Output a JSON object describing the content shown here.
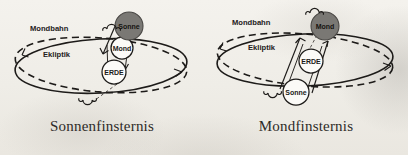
{
  "figure": {
    "background_color": "#f1efea",
    "ink_color": "#1d1b19",
    "shaded_body_color": "#7a7874"
  },
  "panels": [
    {
      "id": "solar-eclipse",
      "caption": "Sonnenfinsternis",
      "orbit_labels": {
        "moon_orbit": "Mondbahn",
        "ecliptic": "Ekliptik"
      },
      "bodies": [
        {
          "name": "Sonne",
          "label": "Sonne",
          "fill": "shaded",
          "position": "top"
        },
        {
          "name": "Mond",
          "label": "Mond",
          "fill": "open",
          "position": "middle"
        },
        {
          "name": "Erde",
          "label": "ERDE",
          "fill": "open",
          "position": "bottom"
        }
      ],
      "nodes": [
        {
          "name": "ascending-node",
          "symbol": "☊",
          "position": "top-left-of-sun"
        },
        {
          "name": "descending-node",
          "symbol": "☋",
          "position": "bottom-of-ellipse"
        }
      ]
    },
    {
      "id": "lunar-eclipse",
      "caption": "Mondfinsternis",
      "orbit_labels": {
        "moon_orbit": "Mondbahn",
        "ecliptic": "Ekliptik"
      },
      "bodies": [
        {
          "name": "Mond",
          "label": "Mond",
          "fill": "shaded",
          "position": "top"
        },
        {
          "name": "Erde",
          "label": "ERDE",
          "fill": "open",
          "position": "middle"
        },
        {
          "name": "Sonne",
          "label": "Sonne",
          "fill": "open",
          "position": "bottom"
        }
      ],
      "nodes": [
        {
          "name": "ascending-node",
          "symbol": "☊",
          "position": "above-moon"
        },
        {
          "name": "descending-node",
          "symbol": "☋",
          "position": "left-of-sun"
        }
      ]
    }
  ]
}
